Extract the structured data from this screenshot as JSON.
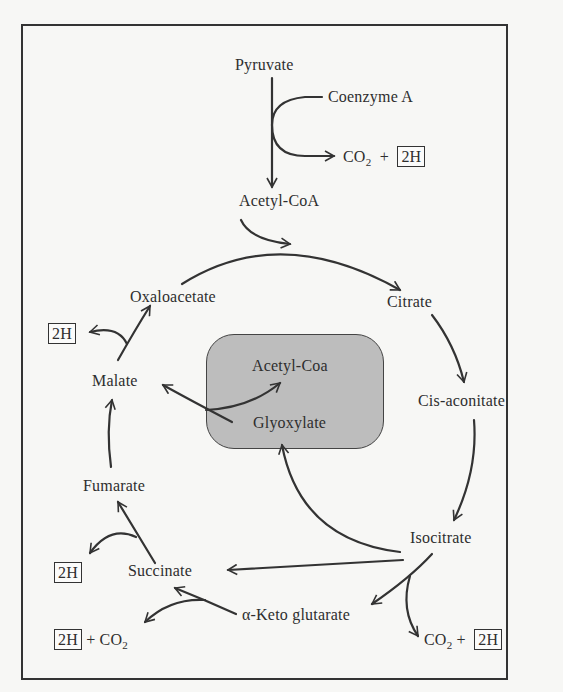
{
  "diagram": {
    "entry": {
      "pyruvate": "Pyruvate",
      "coenzyme_a": "Coenzyme A",
      "acetyl_coa": "Acetyl-CoA",
      "byproduct_co2": "CO",
      "co2_sub": "2",
      "plus": "+",
      "hydrogen": "2H"
    },
    "cycle": {
      "citrate": "Citrate",
      "cis_aconitate": "Cis-aconitate",
      "isocitrate": "Isocitrate",
      "alpha_keto_glutarate": "α-Keto glutarate",
      "succinate": "Succinate",
      "fumarate": "Fumarate",
      "malate": "Malate",
      "oxaloacetate": "Oxaloacetate"
    },
    "shunt": {
      "acetyl_coa": "Acetyl-Coa",
      "glyoxylate": "Glyoxylate",
      "fill_color": "#bdbdbd"
    },
    "byproducts": {
      "malate_to_oaa_h": "2H",
      "succinate_to_fumarate_h": "2H",
      "akg_to_succinate_h": "2H",
      "akg_to_succinate_co2": "CO",
      "isocitrate_to_akg_co2": "CO",
      "isocitrate_to_akg_h": "2H",
      "co2_sub": "2",
      "plus": "+"
    }
  }
}
